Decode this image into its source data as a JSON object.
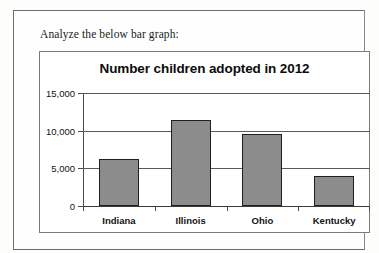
{
  "document": {
    "prompt": "Analyze the below bar graph:"
  },
  "chart_data": {
    "type": "bar",
    "title": "Number children adopted in 2012",
    "xlabel": "",
    "ylabel": "",
    "categories": [
      "Indiana",
      "Illinois",
      "Ohio",
      "Kentucky"
    ],
    "values": [
      6300,
      11400,
      9500,
      4000
    ],
    "ylim": [
      0,
      15000
    ],
    "ytick_labels": [
      "0",
      "5,000",
      "10,000",
      "15,000"
    ],
    "ytick_values": [
      0,
      5000,
      10000,
      15000
    ],
    "grid": true,
    "legend": false,
    "bar_color": "#8c8c8c",
    "bar_border_color": "#1f1f1f",
    "axis_color": "#4a4a4a",
    "plot_background": "#ffffff"
  }
}
